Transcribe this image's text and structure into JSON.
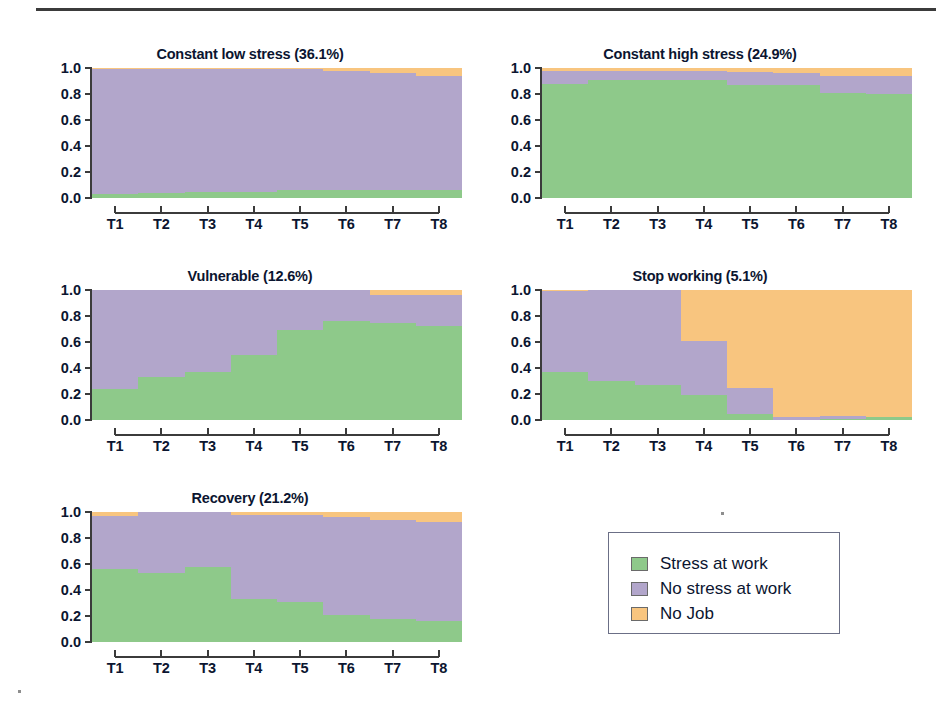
{
  "figure": {
    "panel_titles": [
      "Constant low stress (36.1%)",
      "Constant high stress (24.9%)",
      "Vulnerable (12.6%)",
      "Stop working (5.1%)",
      "Recovery (21.2%)"
    ]
  },
  "axes": {
    "y_ticks": [
      "0.0",
      "0.2",
      "0.4",
      "0.6",
      "0.8",
      "1.0"
    ],
    "x_ticks": [
      "T1",
      "T2",
      "T3",
      "T4",
      "T5",
      "T6",
      "T7",
      "T8"
    ]
  },
  "legend": {
    "items": [
      {
        "label": "Stress at work",
        "color": "#8ec98a"
      },
      {
        "label": "No stress at work",
        "color": "#b2a6cb"
      },
      {
        "label": "No Job",
        "color": "#f8c57f"
      }
    ]
  },
  "colors": {
    "stress_at_work": "#8ec98a",
    "no_stress_at_work": "#b2a6cb",
    "no_job": "#f8c57f",
    "axis": "#3b3b3b",
    "text": "#0b1530",
    "background": "#ffffff"
  },
  "chart_data": {
    "type": "area",
    "xlabel": "",
    "ylabel": "",
    "ylim": [
      0,
      1
    ],
    "grid": false,
    "legend_position": "bottom-right",
    "x": [
      "T1",
      "T2",
      "T3",
      "T4",
      "T5",
      "T6",
      "T7",
      "T8"
    ],
    "stack_order": [
      "Stress at work",
      "No stress at work",
      "No Job"
    ],
    "panels": [
      {
        "name": "Constant low stress",
        "share": 36.1,
        "title": "Constant low stress (36.1%)",
        "series": [
          {
            "name": "Stress at work",
            "values": [
              0.03,
              0.04,
              0.05,
              0.05,
              0.06,
              0.06,
              0.06,
              0.06
            ]
          },
          {
            "name": "No stress at work",
            "values": [
              0.96,
              0.95,
              0.94,
              0.94,
              0.93,
              0.92,
              0.9,
              0.88
            ]
          },
          {
            "name": "No Job",
            "values": [
              0.01,
              0.01,
              0.01,
              0.01,
              0.01,
              0.02,
              0.04,
              0.06
            ]
          }
        ]
      },
      {
        "name": "Constant high stress",
        "share": 24.9,
        "title": "Constant high stress (24.9%)",
        "series": [
          {
            "name": "Stress at work",
            "values": [
              0.88,
              0.91,
              0.91,
              0.91,
              0.87,
              0.87,
              0.81,
              0.8
            ]
          },
          {
            "name": "No stress at work",
            "values": [
              0.1,
              0.07,
              0.07,
              0.07,
              0.1,
              0.09,
              0.13,
              0.14
            ]
          },
          {
            "name": "No Job",
            "values": [
              0.02,
              0.02,
              0.02,
              0.02,
              0.03,
              0.04,
              0.06,
              0.06
            ]
          }
        ]
      },
      {
        "name": "Vulnerable",
        "share": 12.6,
        "title": "Vulnerable (12.6%)",
        "series": [
          {
            "name": "Stress at work",
            "values": [
              0.24,
              0.33,
              0.37,
              0.5,
              0.69,
              0.76,
              0.75,
              0.72
            ]
          },
          {
            "name": "No stress at work",
            "values": [
              0.76,
              0.67,
              0.63,
              0.5,
              0.31,
              0.24,
              0.21,
              0.24
            ]
          },
          {
            "name": "No Job",
            "values": [
              0.0,
              0.0,
              0.0,
              0.0,
              0.0,
              0.0,
              0.04,
              0.04
            ]
          }
        ]
      },
      {
        "name": "Stop working",
        "share": 5.1,
        "title": "Stop working (5.1%)",
        "series": [
          {
            "name": "Stress at work",
            "values": [
              0.37,
              0.3,
              0.27,
              0.19,
              0.05,
              0.0,
              0.01,
              0.02
            ]
          },
          {
            "name": "No stress at work",
            "values": [
              0.62,
              0.7,
              0.73,
              0.42,
              0.2,
              0.02,
              0.02,
              0.0
            ]
          },
          {
            "name": "No Job",
            "values": [
              0.01,
              0.0,
              0.0,
              0.39,
              0.75,
              0.98,
              0.97,
              0.98
            ]
          }
        ]
      },
      {
        "name": "Recovery",
        "share": 21.2,
        "title": "Recovery (21.2%)",
        "series": [
          {
            "name": "Stress at work",
            "values": [
              0.56,
              0.53,
              0.58,
              0.33,
              0.31,
              0.21,
              0.18,
              0.16
            ]
          },
          {
            "name": "No stress at work",
            "values": [
              0.41,
              0.47,
              0.42,
              0.65,
              0.67,
              0.75,
              0.76,
              0.76
            ]
          },
          {
            "name": "No Job",
            "values": [
              0.03,
              0.0,
              0.0,
              0.02,
              0.02,
              0.04,
              0.06,
              0.08
            ]
          }
        ]
      }
    ]
  }
}
